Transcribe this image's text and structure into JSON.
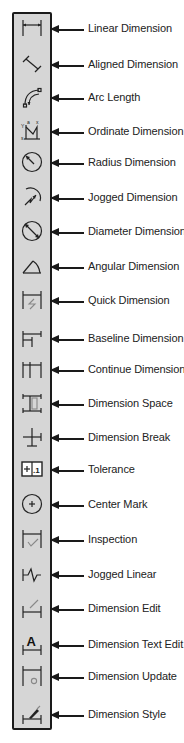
{
  "colors": {
    "toolbar_bg": "#d6d6d6",
    "toolbar_border": "#1a1a1a",
    "arrow": "#1a1a1a",
    "text": "#222222"
  },
  "tools": [
    {
      "label": "Linear Dimension",
      "icon": "linear-dimension-icon",
      "y": 30
    },
    {
      "label": "Aligned Dimension",
      "icon": "aligned-dimension-icon",
      "y": 66
    },
    {
      "label": "Arc Length",
      "icon": "arc-length-icon",
      "y": 99
    },
    {
      "label": "Ordinate Dimension",
      "icon": "ordinate-dimension-icon",
      "y": 133
    },
    {
      "label": "Radius Dimension",
      "icon": "radius-dimension-icon",
      "y": 164
    },
    {
      "label": "Jogged Dimension",
      "icon": "jogged-dimension-icon",
      "y": 199
    },
    {
      "label": "Diameter Dimension",
      "icon": "diameter-dimension-icon",
      "y": 233
    },
    {
      "label": "Angular Dimension",
      "icon": "angular-dimension-icon",
      "y": 268
    },
    {
      "label": "Quick Dimension",
      "icon": "quick-dimension-icon",
      "y": 302
    },
    {
      "label": "Baseline Dimension",
      "icon": "baseline-dimension-icon",
      "y": 340
    },
    {
      "label": "Continue Dimension",
      "icon": "continue-dimension-icon",
      "y": 371
    },
    {
      "label": "Dimension Space",
      "icon": "dimension-space-icon",
      "y": 405
    },
    {
      "label": "Dimension Break",
      "icon": "dimension-break-icon",
      "y": 439
    },
    {
      "label": "Tolerance",
      "icon": "tolerance-icon",
      "y": 471
    },
    {
      "label": "Center Mark",
      "icon": "center-mark-icon",
      "y": 506
    },
    {
      "label": "Inspection",
      "icon": "inspection-icon",
      "y": 541
    },
    {
      "label": "Jogged Linear",
      "icon": "jogged-linear-icon",
      "y": 576
    },
    {
      "label": "Dimension Edit",
      "icon": "dimension-edit-icon",
      "y": 610
    },
    {
      "label": "Dimension Text Edit",
      "icon": "dimension-text-edit-icon",
      "y": 646
    },
    {
      "label": "Dimension Update",
      "icon": "dimension-update-icon",
      "y": 678
    },
    {
      "label": "Dimension Style",
      "icon": "dimension-style-icon",
      "y": 716
    }
  ],
  "glyphs": {
    "text_edit": "A",
    "tolerance": "+.1"
  }
}
